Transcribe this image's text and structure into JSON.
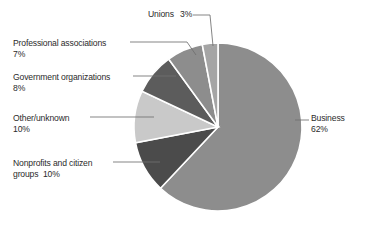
{
  "chart_data": {
    "type": "pie",
    "title": "",
    "subtitle": "",
    "xlabel": "",
    "ylabel": "",
    "grid": false,
    "legend_position": "none",
    "labels_with_leader_lines": true,
    "units": "percent",
    "total": "100%",
    "start_angle_deg": 0,
    "direction": "clockwise",
    "categories": [
      "Business",
      "Nonprofits and citizen groups",
      "Other/unknown",
      "Government organizations",
      "Professional associations",
      "Unions"
    ],
    "values": [
      62,
      10,
      10,
      8,
      7,
      3
    ],
    "value_labels": [
      "62%",
      "10%",
      "10%",
      "8%",
      "7%",
      "3%"
    ],
    "colors": [
      "#8d8d8d",
      "#4b4b4b",
      "#c9c9c9",
      "#5c5c5c",
      "#8d8d8d",
      "#a5a5a5"
    ],
    "slice_border_color": "#ffffff",
    "slices": [
      {
        "name": "Business",
        "value": 62,
        "value_label": "62%",
        "color": "#8d8d8d"
      },
      {
        "name": "Nonprofits and citizen groups",
        "value": 10,
        "value_label": "10%",
        "color": "#4b4b4b"
      },
      {
        "name": "Other/unknown",
        "value": 10,
        "value_label": "10%",
        "color": "#c9c9c9"
      },
      {
        "name": "Government organizations",
        "value": 8,
        "value_label": "8%",
        "color": "#5c5c5c"
      },
      {
        "name": "Professional associations",
        "value": 7,
        "value_label": "7%",
        "color": "#8d8d8d"
      },
      {
        "name": "Unions",
        "value": 3,
        "value_label": "3%",
        "color": "#a5a5a5"
      }
    ]
  },
  "annotations": {
    "unions": {
      "label": "Unions",
      "value_label": "3%"
    },
    "professional": {
      "label": "Professional associations",
      "value_label": "7%"
    },
    "government": {
      "label": "Government organizations",
      "value_label": "8%"
    },
    "other": {
      "label": "Other/unknown",
      "value_label": "10%"
    },
    "nonprofits": {
      "label": "Nonprofits and citizen",
      "label_line2": "groups",
      "value_label": "10%"
    },
    "business": {
      "label": "Business",
      "value_label": "62%"
    }
  },
  "style": {
    "background": "#ffffff",
    "text_color": "#2b2b2b",
    "leader_line_color": "#6f6f6f"
  }
}
